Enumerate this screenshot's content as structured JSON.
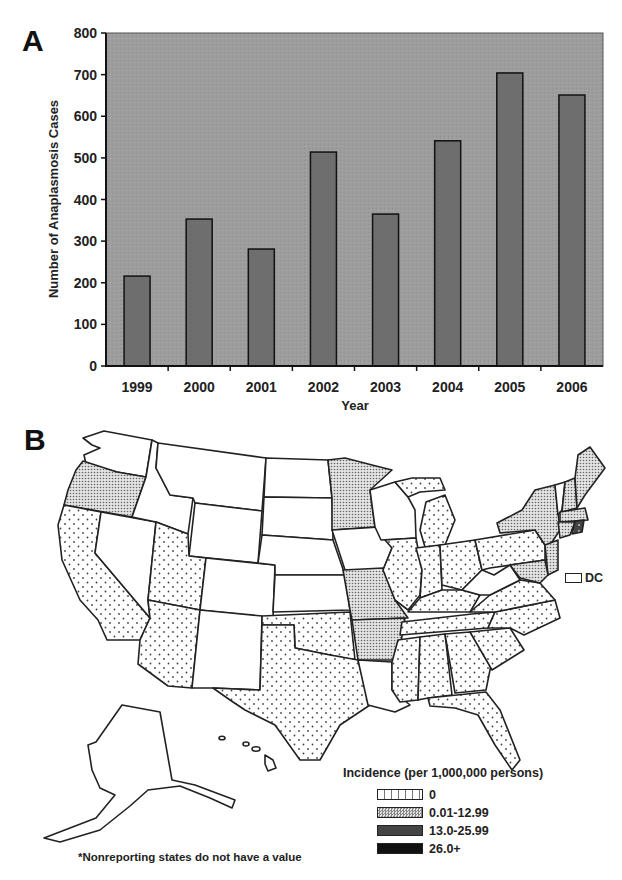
{
  "panel_a": {
    "label": "A"
  },
  "panel_b": {
    "label": "B"
  },
  "chart_data": [
    {
      "type": "bar",
      "title": "",
      "xlabel": "Year",
      "ylabel": "Number of Anaplasmosis Cases",
      "categories": [
        "1999",
        "2000",
        "2001",
        "2002",
        "2003",
        "2004",
        "2005",
        "2006"
      ],
      "values": [
        216,
        353,
        281,
        514,
        365,
        541,
        704,
        651
      ],
      "ylim": [
        0,
        800
      ],
      "yticks": [
        0,
        100,
        200,
        300,
        400,
        500,
        600,
        700,
        800
      ],
      "grid": false,
      "plot_background": "#9a9a9a",
      "bar_color": "#6e6e6e"
    },
    {
      "type": "choropleth-map",
      "title": "",
      "legend_title": "Incidence (per 1,000,000 persons)",
      "legend": [
        {
          "label": "0",
          "pattern": "sparse-dots"
        },
        {
          "label": "0.01-12.99",
          "pattern": "dense-dots"
        },
        {
          "label": "13.0-25.99",
          "pattern": "dark-dots"
        },
        {
          "label": "26.0+",
          "pattern": "solid-dark"
        }
      ],
      "categories": {
        "0.01-12.99": [
          "OR",
          "MN",
          "MO",
          "AR",
          "NY",
          "ME",
          "NH",
          "VT",
          "NJ",
          "MD",
          "DE",
          "MA",
          "CT"
        ],
        "0": [
          "CA",
          "UT",
          "AZ",
          "TX",
          "OK",
          "IL",
          "MI",
          "IN",
          "OH",
          "PA",
          "KY",
          "TN",
          "VA",
          "NC",
          "SC",
          "GA",
          "AL",
          "FL",
          "MS",
          "WI-UP"
        ],
        "13.0-25.99": [
          "RI"
        ],
        "nonreporting": [
          "WA",
          "ID",
          "MT",
          "WY",
          "NV",
          "CO",
          "NM",
          "ND",
          "SD",
          "NE",
          "KS",
          "IA",
          "WI",
          "LA",
          "WV",
          "AK",
          "HI"
        ]
      },
      "dc_label": "DC",
      "footnote": "*Nonreporting states do not have a value"
    }
  ],
  "axis": {
    "ylabel": "Number of Anaplasmosis Cases",
    "xlabel": "Year"
  },
  "legend": {
    "title": "Incidence (per 1,000,000 persons)",
    "items": [
      {
        "label": "0"
      },
      {
        "label": "0.01-12.99"
      },
      {
        "label": "13.0-25.99"
      },
      {
        "label": "26.0+"
      }
    ]
  },
  "map": {
    "dc_label": "DC",
    "footnote": "*Nonreporting states do not have a value"
  }
}
